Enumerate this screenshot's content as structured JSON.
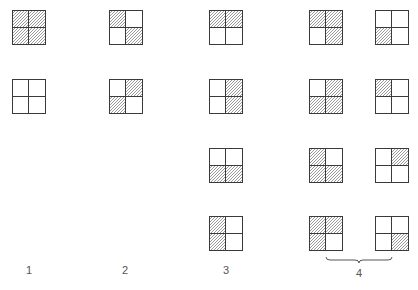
{
  "figure": {
    "type": "grid-pattern-diagram",
    "colors": {
      "border": "#3a3a3a",
      "hatch": "#9a9a9a",
      "background": "#ffffff",
      "label": "#555555"
    },
    "cell_order": [
      "tl",
      "tr",
      "bl",
      "br"
    ],
    "columns": [
      {
        "label": "1",
        "label_x": 29,
        "squares": [
          {
            "x": 12,
            "y": 10,
            "shaded": [
              "tl",
              "tr",
              "bl",
              "br"
            ]
          },
          {
            "x": 12,
            "y": 79,
            "shaded": []
          }
        ]
      },
      {
        "label": "2",
        "label_x": 125,
        "squares": [
          {
            "x": 109,
            "y": 10,
            "shaded": [
              "tl",
              "br"
            ]
          },
          {
            "x": 109,
            "y": 79,
            "shaded": [
              "tr",
              "bl"
            ]
          }
        ]
      },
      {
        "label": "3",
        "label_x": 226,
        "squares": [
          {
            "x": 209,
            "y": 10,
            "shaded": [
              "tl",
              "tr"
            ]
          },
          {
            "x": 209,
            "y": 79,
            "shaded": [
              "tr",
              "br"
            ]
          },
          {
            "x": 209,
            "y": 148,
            "shaded": [
              "bl",
              "br"
            ]
          },
          {
            "x": 209,
            "y": 216,
            "shaded": [
              "tl",
              "bl"
            ]
          }
        ]
      },
      {
        "label": "4",
        "label_x": 359,
        "brace": {
          "x1": 326,
          "x2": 392,
          "y": 257
        },
        "squares": [
          {
            "x": 309,
            "y": 10,
            "shaded": [
              "tl",
              "tr",
              "br"
            ]
          },
          {
            "x": 375,
            "y": 10,
            "shaded": [
              "bl"
            ]
          },
          {
            "x": 309,
            "y": 79,
            "shaded": [
              "tr",
              "bl",
              "br"
            ]
          },
          {
            "x": 375,
            "y": 79,
            "shaded": [
              "tl"
            ]
          },
          {
            "x": 309,
            "y": 148,
            "shaded": [
              "tl",
              "bl",
              "br"
            ]
          },
          {
            "x": 375,
            "y": 148,
            "shaded": [
              "tr"
            ]
          },
          {
            "x": 309,
            "y": 216,
            "shaded": [
              "tl",
              "tr",
              "bl"
            ]
          },
          {
            "x": 375,
            "y": 216,
            "shaded": [
              "br"
            ]
          }
        ]
      }
    ],
    "label_y": 264,
    "caption": ""
  }
}
